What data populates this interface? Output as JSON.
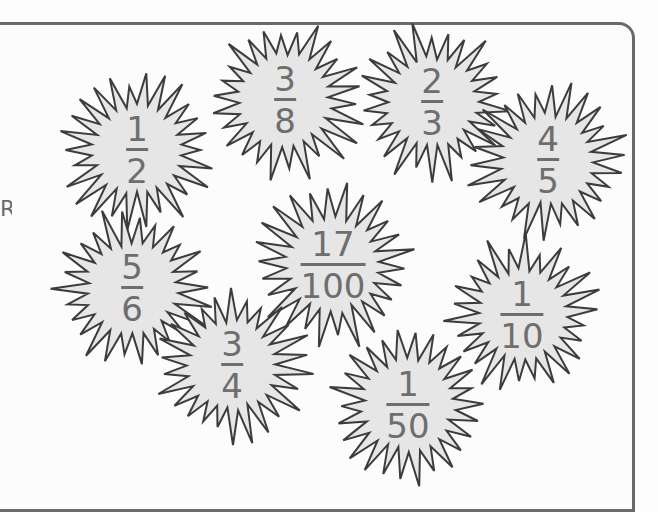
{
  "worksheet": {
    "side_fragment": "R",
    "colors": {
      "star_fill": "#e6e6e6",
      "star_stroke": "#3c3c3c",
      "text": "#6e6e6e",
      "frame": "#6a6a6a"
    },
    "fractions": [
      {
        "numerator": "1",
        "denominator": "2",
        "cx": 137,
        "cy": 150,
        "r": 80
      },
      {
        "numerator": "3",
        "denominator": "8",
        "cx": 285,
        "cy": 100,
        "r": 82
      },
      {
        "numerator": "2",
        "denominator": "3",
        "cx": 432,
        "cy": 102,
        "r": 80
      },
      {
        "numerator": "4",
        "denominator": "5",
        "cx": 548,
        "cy": 160,
        "r": 82
      },
      {
        "numerator": "5",
        "denominator": "6",
        "cx": 132,
        "cy": 288,
        "r": 82
      },
      {
        "numerator": "17",
        "denominator": "100",
        "cx": 333,
        "cy": 265,
        "r": 84
      },
      {
        "numerator": "3",
        "denominator": "4",
        "cx": 232,
        "cy": 365,
        "r": 80
      },
      {
        "numerator": "1",
        "denominator": "10",
        "cx": 522,
        "cy": 315,
        "r": 80
      },
      {
        "numerator": "1",
        "denominator": "50",
        "cx": 408,
        "cy": 405,
        "r": 82
      }
    ]
  }
}
